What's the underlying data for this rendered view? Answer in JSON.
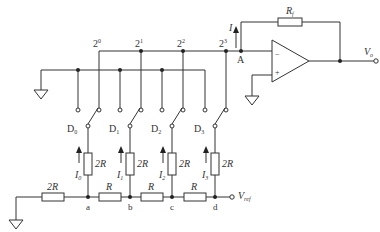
{
  "diagram": {
    "type": "R-2R ladder DAC (inverted ladder, current-output)",
    "opamp": {
      "minus": "−",
      "plus": "+",
      "feedback_resistor": "R",
      "feedback_sub": "f",
      "output": "V",
      "output_sub": "o"
    },
    "node_A": "A",
    "current_I": "I",
    "weights": [
      {
        "base": "2",
        "exp": "0"
      },
      {
        "base": "2",
        "exp": "1"
      },
      {
        "base": "2",
        "exp": "2"
      },
      {
        "base": "2",
        "exp": "3"
      }
    ],
    "switches": [
      {
        "label": "D",
        "sub": "0"
      },
      {
        "label": "D",
        "sub": "1"
      },
      {
        "label": "D",
        "sub": "2"
      },
      {
        "label": "D",
        "sub": "3"
      }
    ],
    "branch_resistors": [
      "2R",
      "2R",
      "2R",
      "2R"
    ],
    "branch_currents": [
      {
        "label": "I",
        "sub": "0"
      },
      {
        "label": "I",
        "sub": "1"
      },
      {
        "label": "I",
        "sub": "2"
      },
      {
        "label": "I",
        "sub": "3"
      }
    ],
    "ladder_resistors": {
      "termination": "2R",
      "series": [
        "R",
        "R",
        "R"
      ]
    },
    "nodes": [
      "a",
      "b",
      "c",
      "d"
    ],
    "vref": {
      "label": "V",
      "sub": "ref"
    }
  }
}
